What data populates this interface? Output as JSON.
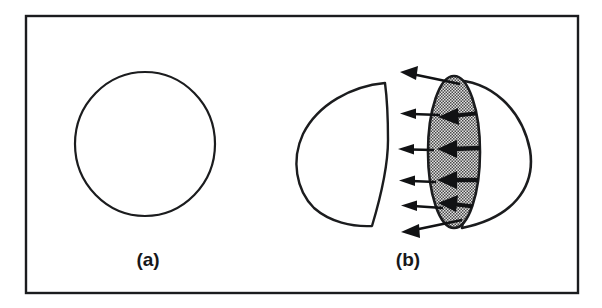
{
  "figure": {
    "kind": "scientific-line-diagram",
    "caption_labels": [
      {
        "id": "a",
        "text": "(a)",
        "x": 148,
        "y": 266
      },
      {
        "id": "b",
        "text": "(b)",
        "x": 408,
        "y": 266
      }
    ],
    "frame": {
      "name": "figure-border",
      "x": 26,
      "y": 16,
      "width": 552,
      "height": 277,
      "stroke_color": "#1b1c1e",
      "stroke_width": 2.4,
      "fill_color": "#ffffff"
    },
    "colors": {
      "ink": "#17181a",
      "outline": "#1b1c1e",
      "paper": "#ffffff",
      "stipple_fill": "#d2d2d2",
      "stipple_dot": "#3a3a3a",
      "arrow_fill": "#111214"
    },
    "panels": [
      {
        "id": "a",
        "name": "panel-a-undeformed-nucleus",
        "description": "Unperturbed spherical outline",
        "shapes": [
          {
            "name": "sphere-outline",
            "type": "closed-curve",
            "center_x": 145,
            "center_y": 144,
            "radius_x": 70,
            "radius_y": 72,
            "fill": "none",
            "stroke": "#1b1c1e",
            "stroke_width": 2.2
          }
        ]
      },
      {
        "id": "b",
        "name": "panel-b-deformed-nucleus",
        "description": "Separated fragment (left D-shape) and stippled neck disc with outward and inward surface-force arrows over the residual sphere arc",
        "shapes": [
          {
            "name": "left-fragment-outline",
            "type": "closed-curve",
            "bbox": {
              "x": 297,
              "y": 82,
              "width": 93,
              "height": 145
            },
            "fill": "none",
            "stroke": "#1b1c1e",
            "stroke_width": 2.4
          },
          {
            "name": "right-sphere-arc",
            "type": "open-arc",
            "bbox": {
              "x": 438,
              "y": 76,
              "width": 96,
              "height": 152
            },
            "fill": "none",
            "stroke": "#1b1c1e",
            "stroke_width": 2.6
          },
          {
            "name": "stippled-neck-disc",
            "type": "ellipse",
            "center_x": 454,
            "center_y": 152,
            "radius_x": 26,
            "radius_y": 76,
            "fill": "stipple",
            "stroke": "#1b1c1e",
            "stroke_width": 2.6
          }
        ],
        "outer_arrows": {
          "name": "outward-force-arrows",
          "count": 6,
          "direction": "left",
          "description": "Arrows pointing away from the stippled disc toward the left",
          "items": [
            {
              "x1": 452,
              "y1": 84,
              "x2": 404,
              "y2": 75,
              "head": 11,
              "width": 2.4
            },
            {
              "x1": 440,
              "y1": 115,
              "x2": 406,
              "y2": 113,
              "head": 9,
              "width": 2.2
            },
            {
              "x1": 434,
              "y1": 150,
              "x2": 404,
              "y2": 149,
              "head": 9,
              "width": 2.2
            },
            {
              "x1": 436,
              "y1": 182,
              "x2": 405,
              "y2": 181,
              "head": 9,
              "width": 2.2
            },
            {
              "x1": 443,
              "y1": 208,
              "x2": 407,
              "y2": 206,
              "head": 9,
              "width": 2.2
            },
            {
              "x1": 455,
              "y1": 221,
              "x2": 404,
              "y2": 231,
              "head": 11,
              "width": 2.4
            }
          ]
        },
        "inner_arrows": {
          "name": "internal-force-arrows",
          "count": 4,
          "direction": "left",
          "description": "Heavy arrows inside the stippled disc pointing left",
          "items": [
            {
              "x1": 478,
              "y1": 112,
              "x2": 448,
              "y2": 116,
              "head": 12,
              "width": 4.0
            },
            {
              "x1": 481,
              "y1": 148,
              "x2": 447,
              "y2": 149,
              "head": 13,
              "width": 4.4
            },
            {
              "x1": 480,
              "y1": 180,
              "x2": 448,
              "y2": 180,
              "head": 13,
              "width": 4.4
            },
            {
              "x1": 476,
              "y1": 206,
              "x2": 449,
              "y2": 203,
              "head": 12,
              "width": 4.0
            }
          ]
        }
      }
    ]
  }
}
